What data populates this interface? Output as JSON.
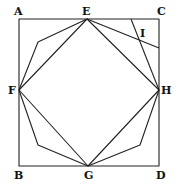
{
  "diagram": {
    "type": "geometric-construction",
    "labels": {
      "A": "A",
      "C": "C",
      "E": "E",
      "I": "I",
      "F": "F",
      "H": "H",
      "B": "B",
      "G": "G",
      "D": "D"
    },
    "points": {
      "A": [
        19,
        19
      ],
      "C": [
        159,
        19
      ],
      "B": [
        19,
        166
      ],
      "D": [
        159,
        166
      ],
      "E": [
        87,
        19
      ],
      "F": [
        19,
        90
      ],
      "H": [
        159,
        90
      ],
      "G": [
        88,
        166
      ],
      "P1": [
        38,
        42
      ],
      "P2": [
        38,
        145
      ],
      "P3": [
        140,
        145
      ],
      "P4": [
        159,
        48
      ],
      "P5": [
        131,
        19
      ]
    },
    "stroke_color": "#222222"
  }
}
